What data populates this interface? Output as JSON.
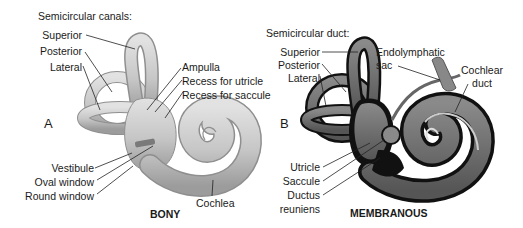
{
  "figure": {
    "bony": {
      "panel_letter": "A",
      "caption": "BONY",
      "header": "Semicircular canals:",
      "labels": {
        "superior": "Superior",
        "posterior": "Posterior",
        "lateral": "Lateral",
        "ampulla": "Ampulla",
        "recess_utricle": "Recess for utricle",
        "recess_saccule": "Recess for saccule",
        "vestibule": "Vestibule",
        "oval_window": "Oval window",
        "round_window": "Round window",
        "cochlea": "Cochlea"
      },
      "colors": {
        "fill": "#c9c9c9",
        "shade": "#9a9a9a",
        "highlight": "#e6e6e6"
      }
    },
    "membranous": {
      "panel_letter": "B",
      "caption": "MEMBRANOUS",
      "header": "Semicircular duct:",
      "labels": {
        "superior": "Superior",
        "posterior": "Posterior",
        "lateral": "Lateral",
        "endolymphatic_1": "Endolymphatic",
        "endolymphatic_2": "sac",
        "cochlear_duct_1": "Cochlear",
        "cochlear_duct_2": "duct",
        "utricle": "Utricle",
        "saccule": "Saccule",
        "ductus_1": "Ductus",
        "ductus_2": "reuniens"
      },
      "colors": {
        "outer": "#111111",
        "fill": "#6e6e6e",
        "light": "#a8a8a8"
      }
    }
  }
}
